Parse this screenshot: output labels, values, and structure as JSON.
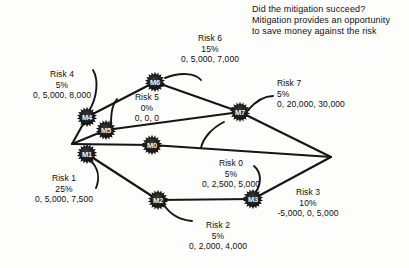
{
  "header": {
    "line1": "Did the mitigation succeed?",
    "line2": "Mitigation provides an opportunity",
    "line3": "to save money against the risk"
  },
  "colors": {
    "background": "#fdfdfc",
    "ink": "#111111",
    "node_fill": "#1a1a1a",
    "node_text": "#f2f2f2",
    "edge": "#151515"
  },
  "nodes": [
    {
      "id": "M0",
      "label": "M0",
      "x": 152,
      "y": 145
    },
    {
      "id": "M1",
      "label": "M1",
      "x": 87,
      "y": 154
    },
    {
      "id": "M2",
      "label": "M2",
      "x": 158,
      "y": 200
    },
    {
      "id": "M3",
      "label": "M3",
      "x": 253,
      "y": 199
    },
    {
      "id": "M4",
      "label": "M4",
      "x": 87,
      "y": 117
    },
    {
      "id": "M5",
      "label": "M5",
      "x": 106,
      "y": 130
    },
    {
      "id": "M6",
      "label": "M6",
      "x": 155,
      "y": 82
    },
    {
      "id": "M7",
      "label": "M7",
      "x": 240,
      "y": 112
    }
  ],
  "vertices": {
    "left_fan": {
      "x": 72,
      "y": 144
    },
    "right_fan": {
      "x": 331,
      "y": 157
    }
  },
  "risks": [
    {
      "id": "risk0",
      "name": "Risk 0",
      "probability": "5%",
      "values": "0, 2,500, 5,000",
      "label_x": 231,
      "label_y": 158,
      "align": "center"
    },
    {
      "id": "risk1",
      "name": "Risk 1",
      "probability": "25%",
      "values": "0, 5,000, 7,500",
      "label_x": 64,
      "label_y": 173,
      "align": "center"
    },
    {
      "id": "risk2",
      "name": "Risk 2",
      "probability": "5%",
      "values": "0, 2,000, 4,000",
      "label_x": 218,
      "label_y": 220,
      "align": "center"
    },
    {
      "id": "risk3",
      "name": "Risk 3",
      "probability": "10%",
      "values": "-5,000, 0, 5,000",
      "label_x": 308,
      "label_y": 187,
      "align": "center"
    },
    {
      "id": "risk4",
      "name": "Risk 4",
      "probability": "5%",
      "values": "0, 5,000, 8,000",
      "label_x": 62,
      "label_y": 69,
      "align": "center"
    },
    {
      "id": "risk5",
      "name": "Risk 5",
      "probability": "0%",
      "values": "0, 0, 0",
      "label_x": 147,
      "label_y": 92,
      "align": "center"
    },
    {
      "id": "risk6",
      "name": "Risk 6",
      "probability": "15%",
      "values": "0, 5,000, 7,000",
      "label_x": 210,
      "label_y": 33,
      "align": "center"
    },
    {
      "id": "risk7",
      "name": "Risk 7",
      "probability": "5%",
      "values": "0, 20,000, 30,000",
      "label_x": 277,
      "label_y": 78,
      "align": "left"
    }
  ],
  "edges": [
    {
      "from": "left_fan",
      "to": "M4",
      "kind": "straight"
    },
    {
      "from": "M4",
      "to": "M6",
      "kind": "straight"
    },
    {
      "from": "M6",
      "to": "M7",
      "kind": "straight"
    },
    {
      "from": "M7",
      "to": "right_fan",
      "kind": "straight"
    },
    {
      "from": "left_fan",
      "to": "M5",
      "kind": "straight"
    },
    {
      "from": "M5",
      "to": "M7",
      "kind": "straight"
    },
    {
      "from": "left_fan",
      "to": "M0",
      "kind": "straight"
    },
    {
      "from": "M0",
      "to": "right_fan",
      "kind": "straight"
    },
    {
      "from": "M1",
      "to": "M2",
      "kind": "straight"
    },
    {
      "from": "M2",
      "to": "M3",
      "kind": "straight"
    },
    {
      "from": "M3",
      "to": "right_fan",
      "kind": "straight"
    }
  ]
}
